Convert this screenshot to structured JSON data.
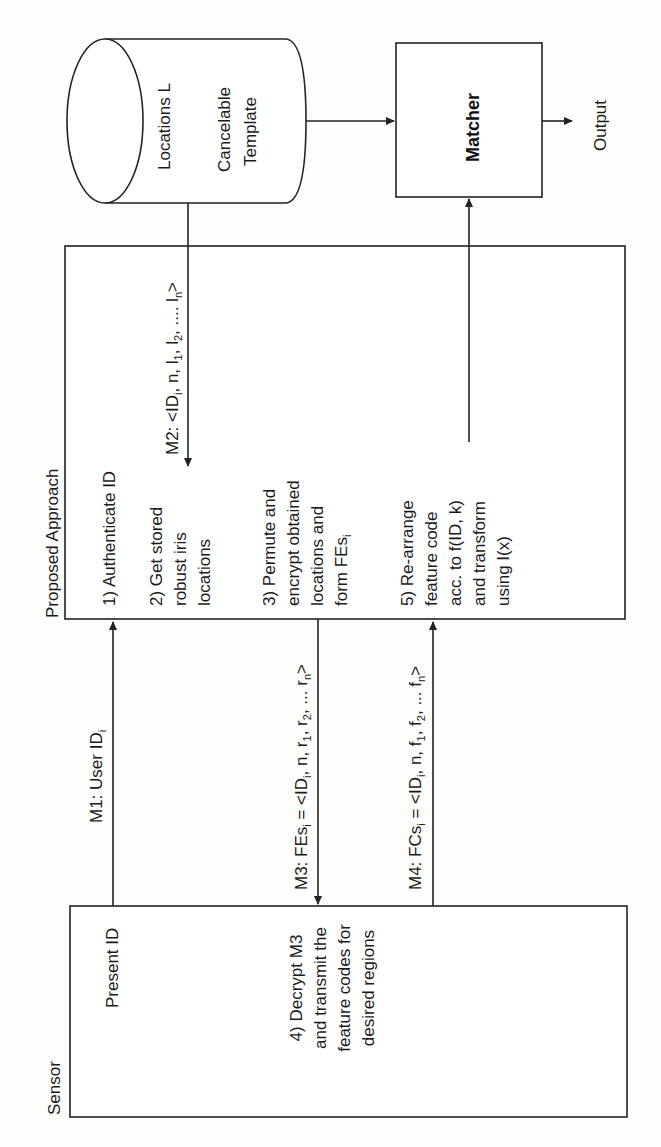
{
  "diagram": {
    "title_rotation": "text rotated 90deg counter-clockwise",
    "database": {
      "line1": "Locations L",
      "line2": "Cancelable",
      "line3": "Template"
    },
    "matcher": {
      "label": "Matcher"
    },
    "output": {
      "label": "Output"
    },
    "proposed": {
      "title": "Proposed Approach",
      "steps": [
        {
          "lines": [
            "1) Authenticate ID"
          ]
        },
        {
          "lines": [
            "2) Get stored",
            "robust iris",
            "locations"
          ]
        },
        {
          "lines": [
            "3) Permute and",
            "encrypt obtained",
            "locations and",
            "form FEs"
          ],
          "sub": "i"
        },
        {
          "lines": [
            "5) Re-arrange",
            "feature code",
            "acc. to f(ID, k)",
            "and transform",
            "using I(x)"
          ]
        }
      ]
    },
    "sensor": {
      "title": "Sensor",
      "present": "Present ID",
      "step4": [
        "4) Decrypt M3",
        "and transmit the",
        "feature codes for",
        "desired regions"
      ]
    },
    "messages": {
      "m1": {
        "prefix": "M1: User ID",
        "sub": "i"
      },
      "m2": {
        "prefix": "M2: <ID",
        "sub_i": "i",
        "mid": ", n, l",
        "s1": "1",
        "c1": ", l",
        "s2": "2",
        "c2": ", .... l",
        "sn": "n",
        "end": ">"
      },
      "m3": {
        "prefix": "M3: FEs",
        "sub_i": "i",
        "eq": " = <ID",
        "sub_i2": "i",
        "mid": ", n, r",
        "s1": "1",
        "c1": ", r",
        "s2": "2",
        "c2": ", ... r",
        "sn": "n",
        "end": ">"
      },
      "m4": {
        "prefix": "M4: FCs",
        "sub_i": "i",
        "eq": " = <ID",
        "sub_i2": "i",
        "mid": ", n, f",
        "s1": "1",
        "c1": ", f",
        "s2": "2",
        "c2": ", ... f",
        "sn": "n",
        "end": ">"
      }
    },
    "colors": {
      "line": "#222222",
      "background": "#fdfdfb",
      "text": "#1a1a1a"
    }
  }
}
